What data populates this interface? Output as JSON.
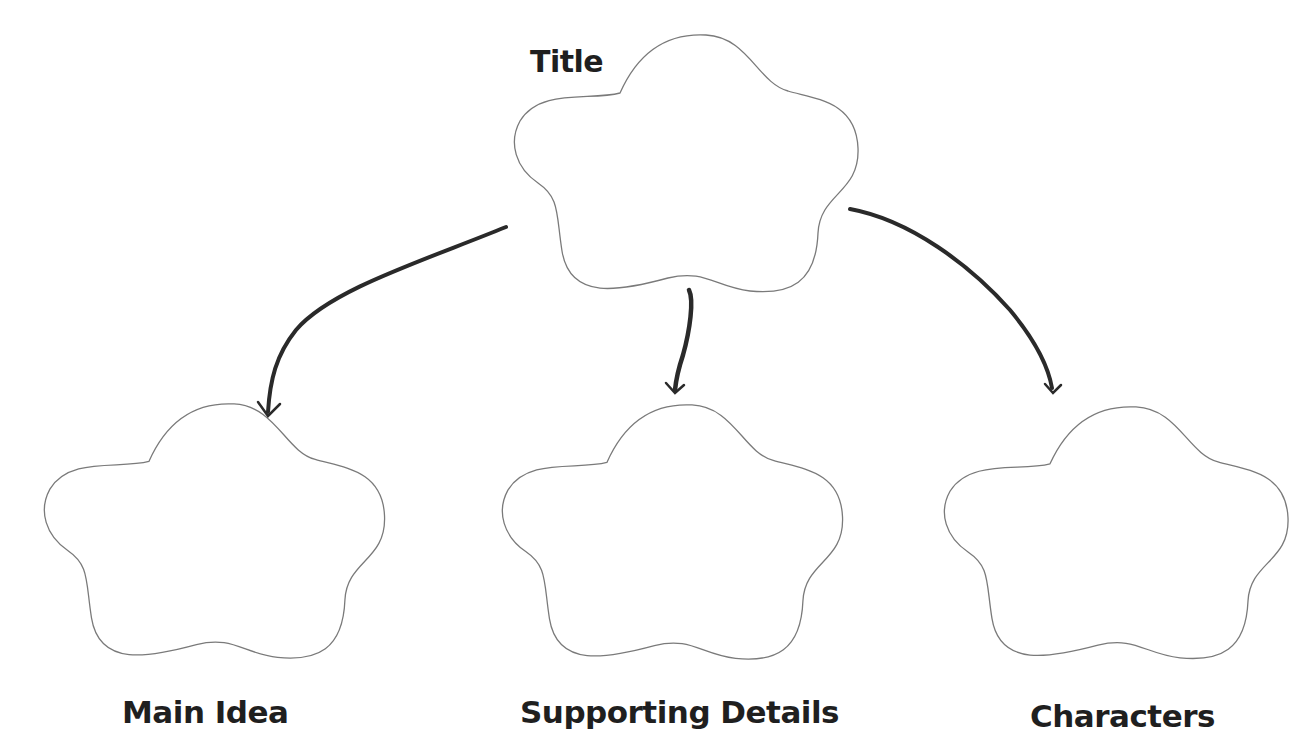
{
  "diagram": {
    "type": "graphic-organizer",
    "root": {
      "label": "Title",
      "shape": "flower-outline",
      "content": ""
    },
    "children": [
      {
        "label": "Main Idea",
        "shape": "flower-outline",
        "content": ""
      },
      {
        "label": "Supporting Details",
        "shape": "flower-outline",
        "content": ""
      },
      {
        "label": "Characters",
        "shape": "flower-outline",
        "content": ""
      }
    ],
    "edges": [
      {
        "from": "Title",
        "to": "Main Idea",
        "style": "hand-drawn-arrow"
      },
      {
        "from": "Title",
        "to": "Supporting Details",
        "style": "hand-drawn-arrow"
      },
      {
        "from": "Title",
        "to": "Characters",
        "style": "hand-drawn-arrow"
      }
    ],
    "colors": {
      "background": "#ffffff",
      "shape_outline": "#7a7a7a",
      "arrow": "#2a2a2a",
      "label_text": "#1f1f1f"
    }
  }
}
